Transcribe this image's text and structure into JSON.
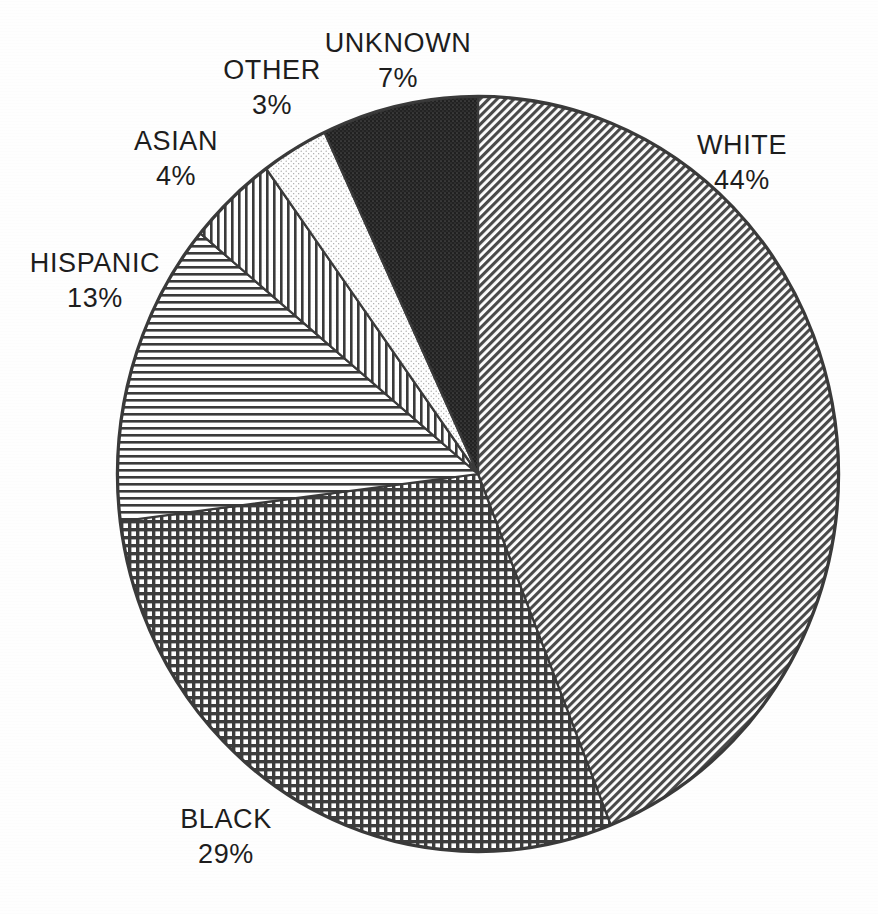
{
  "chart_data": {
    "type": "pie",
    "title": "",
    "subtitle": "",
    "xlabel": "",
    "ylabel": "",
    "legend_position": "outside-labels",
    "grid": false,
    "start_angle_deg": 0,
    "direction": "clockwise",
    "categories": [
      "WHITE",
      "BLACK",
      "HISPANIC",
      "ASIAN",
      "OTHER",
      "UNKNOWN"
    ],
    "values": [
      44,
      29,
      13,
      4,
      3,
      7
    ],
    "value_unit": "%",
    "slices": [
      {
        "label": "WHITE",
        "value": 44,
        "value_text": "44%",
        "fill_pattern": "diagonal-hatch",
        "fill_color": "#8c8c8c",
        "start_deg": 0,
        "end_deg": 158.4
      },
      {
        "label": "BLACK",
        "value": 29,
        "value_text": "29%",
        "fill_pattern": "cross-hatch",
        "fill_color": "#6e6e6e",
        "start_deg": 158.4,
        "end_deg": 262.8
      },
      {
        "label": "HISPANIC",
        "value": 13,
        "value_text": "13%",
        "fill_pattern": "horizontal-lines",
        "fill_color": "#9c9c9c",
        "start_deg": 262.8,
        "end_deg": 309.6
      },
      {
        "label": "ASIAN",
        "value": 4,
        "value_text": "4%",
        "fill_pattern": "vertical-lines",
        "fill_color": "#8f8f8f",
        "start_deg": 309.6,
        "end_deg": 324.0
      },
      {
        "label": "OTHER",
        "value": 3,
        "value_text": "3%",
        "fill_pattern": "light-stipple",
        "fill_color": "#f2f2f2",
        "start_deg": 324.0,
        "end_deg": 334.8
      },
      {
        "label": "UNKNOWN",
        "value": 7,
        "value_text": "7%",
        "fill_pattern": "dark-stipple",
        "fill_color": "#2c2c2c",
        "start_deg": 334.8,
        "end_deg": 360.0
      }
    ]
  },
  "labels": {
    "white": {
      "name": "WHITE",
      "pct": "44%"
    },
    "black": {
      "name": "BLACK",
      "pct": "29%"
    },
    "hispanic": {
      "name": "HISPANIC",
      "pct": "13%"
    },
    "asian": {
      "name": "ASIAN",
      "pct": "4%"
    },
    "other": {
      "name": "OTHER",
      "pct": "3%"
    },
    "unknown": {
      "name": "UNKNOWN",
      "pct": "7%"
    }
  },
  "style": {
    "background": "#ffffff",
    "outline_color": "#3a3a3a",
    "text_color": "#1d1d1d"
  }
}
